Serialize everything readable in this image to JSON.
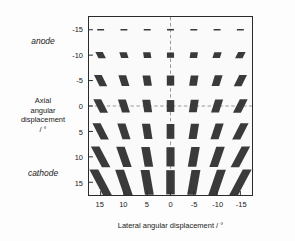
{
  "figure": {
    "annotations": {
      "anode": "anode",
      "cathode": "cathode"
    }
  },
  "chart_data": {
    "type": "scatter",
    "title": "",
    "subtitle": "",
    "xlabel": "Lateral angular displacement / °",
    "ylabel": "Axial angular displacement / °",
    "ylabel_lines": [
      "Axial",
      "angular",
      "displacement",
      "/ °"
    ],
    "xticklabels": [
      "15",
      "10",
      "5",
      "0",
      "-5",
      "-10",
      "-15"
    ],
    "yticklabels": [
      "-15",
      "-10",
      "-5",
      "0",
      "5",
      "10",
      "15"
    ],
    "x": [
      15,
      10,
      5,
      0,
      -5,
      -10,
      -15
    ],
    "y": [
      -15,
      -10,
      -5,
      0,
      5,
      10,
      15
    ],
    "xlim": [
      17.5,
      -17.5
    ],
    "ylim": [
      -17.5,
      17.5
    ],
    "x_axis_reversed": true,
    "grid": false,
    "legend": null,
    "reference_lines": [
      {
        "orientation": "horizontal",
        "value": 0,
        "style": "dashed",
        "color": "#8c8c8c"
      },
      {
        "orientation": "vertical",
        "value": 0,
        "style": "dashed",
        "color": "#8c8c8c"
      }
    ],
    "marker": {
      "shape": "parallelogram",
      "fill": "#3a3a3a",
      "description": "Each grid node carries a filled parallelogram glyph whose vertical extent grows from the anode (top, y=-15) toward the cathode (bottom, y=+15), and whose shear angle increases with the magnitude of the lateral angular displacement, tilting in opposite senses either side of 0."
    },
    "glyphs": [
      {
        "x": 15,
        "y": -15,
        "w": 7.0,
        "h": 1.6,
        "skew": -6
      },
      {
        "x": 10,
        "y": -15,
        "w": 7.0,
        "h": 1.6,
        "skew": -4
      },
      {
        "x": 5,
        "y": -15,
        "w": 7.0,
        "h": 1.6,
        "skew": -2
      },
      {
        "x": 0,
        "y": -15,
        "w": 7.0,
        "h": 1.6,
        "skew": 0
      },
      {
        "x": -5,
        "y": -15,
        "w": 7.0,
        "h": 1.6,
        "skew": 2
      },
      {
        "x": -10,
        "y": -15,
        "w": 7.0,
        "h": 1.6,
        "skew": 4
      },
      {
        "x": -15,
        "y": -15,
        "w": 7.0,
        "h": 1.6,
        "skew": 6
      },
      {
        "x": 15,
        "y": -10,
        "w": 7.5,
        "h": 6.5,
        "skew": -26
      },
      {
        "x": 10,
        "y": -10,
        "w": 7.5,
        "h": 6.0,
        "skew": -17
      },
      {
        "x": 5,
        "y": -10,
        "w": 7.5,
        "h": 5.6,
        "skew": -9
      },
      {
        "x": 0,
        "y": -10,
        "w": 7.2,
        "h": 5.4,
        "skew": 0
      },
      {
        "x": -5,
        "y": -10,
        "w": 7.5,
        "h": 5.6,
        "skew": 9
      },
      {
        "x": -10,
        "y": -10,
        "w": 7.5,
        "h": 6.0,
        "skew": 17
      },
      {
        "x": -15,
        "y": -10,
        "w": 7.5,
        "h": 6.5,
        "skew": 26
      },
      {
        "x": 15,
        "y": -5,
        "w": 7.8,
        "h": 11.5,
        "skew": -26
      },
      {
        "x": 10,
        "y": -5,
        "w": 7.8,
        "h": 11.0,
        "skew": -17
      },
      {
        "x": 5,
        "y": -5,
        "w": 7.8,
        "h": 10.5,
        "skew": -9
      },
      {
        "x": 0,
        "y": -5,
        "w": 7.5,
        "h": 10.2,
        "skew": 0
      },
      {
        "x": -5,
        "y": -5,
        "w": 7.8,
        "h": 10.5,
        "skew": 9
      },
      {
        "x": -10,
        "y": -5,
        "w": 7.8,
        "h": 11.0,
        "skew": 17
      },
      {
        "x": -15,
        "y": -5,
        "w": 7.8,
        "h": 11.5,
        "skew": 26
      },
      {
        "x": 15,
        "y": 0,
        "w": 8.0,
        "h": 13.5,
        "skew": -27
      },
      {
        "x": 10,
        "y": 0,
        "w": 8.0,
        "h": 13.0,
        "skew": -18
      },
      {
        "x": 5,
        "y": 0,
        "w": 8.0,
        "h": 12.5,
        "skew": -9
      },
      {
        "x": 0,
        "y": 0,
        "w": 7.6,
        "h": 12.0,
        "skew": 0
      },
      {
        "x": -5,
        "y": 0,
        "w": 8.0,
        "h": 12.5,
        "skew": 9
      },
      {
        "x": -10,
        "y": 0,
        "w": 8.0,
        "h": 13.0,
        "skew": 18
      },
      {
        "x": -15,
        "y": 0,
        "w": 8.0,
        "h": 13.5,
        "skew": 27
      },
      {
        "x": 15,
        "y": 5,
        "w": 8.2,
        "h": 16.5,
        "skew": -27
      },
      {
        "x": 10,
        "y": 5,
        "w": 8.2,
        "h": 16.0,
        "skew": -18
      },
      {
        "x": 5,
        "y": 5,
        "w": 8.2,
        "h": 15.5,
        "skew": -9
      },
      {
        "x": 0,
        "y": 5,
        "w": 7.8,
        "h": 15.0,
        "skew": 0
      },
      {
        "x": -5,
        "y": 5,
        "w": 8.2,
        "h": 15.5,
        "skew": 9
      },
      {
        "x": -10,
        "y": 5,
        "w": 8.2,
        "h": 16.0,
        "skew": 18
      },
      {
        "x": -15,
        "y": 5,
        "w": 8.2,
        "h": 16.5,
        "skew": 27
      },
      {
        "x": 15,
        "y": 10,
        "w": 8.6,
        "h": 21.0,
        "skew": -28
      },
      {
        "x": 10,
        "y": 10,
        "w": 8.6,
        "h": 20.5,
        "skew": -19
      },
      {
        "x": 5,
        "y": 10,
        "w": 8.6,
        "h": 20.0,
        "skew": -10
      },
      {
        "x": 0,
        "y": 10,
        "w": 8.2,
        "h": 19.5,
        "skew": 0
      },
      {
        "x": -5,
        "y": 10,
        "w": 8.6,
        "h": 20.0,
        "skew": 10
      },
      {
        "x": -10,
        "y": 10,
        "w": 8.6,
        "h": 20.5,
        "skew": 19
      },
      {
        "x": -15,
        "y": 10,
        "w": 8.6,
        "h": 21.0,
        "skew": 28
      },
      {
        "x": 15,
        "y": 15,
        "w": 9.0,
        "h": 26.0,
        "skew": -28
      },
      {
        "x": 10,
        "y": 15,
        "w": 9.0,
        "h": 25.5,
        "skew": -19
      },
      {
        "x": 5,
        "y": 15,
        "w": 9.0,
        "h": 25.0,
        "skew": -10
      },
      {
        "x": 0,
        "y": 15,
        "w": 8.6,
        "h": 24.5,
        "skew": 0
      },
      {
        "x": -5,
        "y": 15,
        "w": 9.0,
        "h": 25.0,
        "skew": 10
      },
      {
        "x": -10,
        "y": 15,
        "w": 9.0,
        "h": 25.5,
        "skew": 19
      },
      {
        "x": -15,
        "y": 15,
        "w": 9.0,
        "h": 26.0,
        "skew": 28
      }
    ]
  }
}
